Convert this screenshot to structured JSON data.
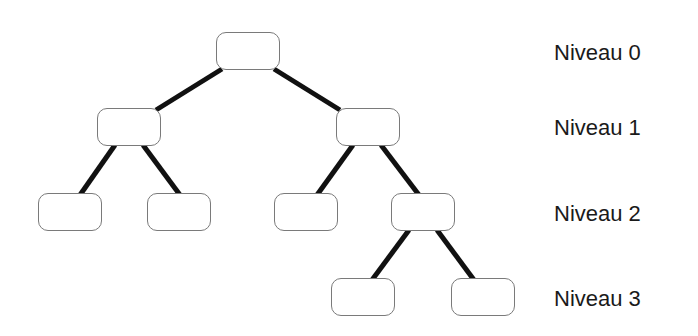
{
  "diagram": {
    "type": "binary-tree",
    "levels": [
      {
        "label": "Niveau 0",
        "y": 42
      },
      {
        "label": "Niveau 1",
        "y": 117
      },
      {
        "label": "Niveau 2",
        "y": 203
      },
      {
        "label": "Niveau 3",
        "y": 288
      }
    ],
    "nodes": [
      {
        "id": "n0",
        "level": 0,
        "x": 216,
        "y": 32
      },
      {
        "id": "n1",
        "level": 1,
        "x": 97,
        "y": 108
      },
      {
        "id": "n2",
        "level": 1,
        "x": 336,
        "y": 108
      },
      {
        "id": "n3",
        "level": 2,
        "x": 38,
        "y": 193
      },
      {
        "id": "n4",
        "level": 2,
        "x": 147,
        "y": 193
      },
      {
        "id": "n5",
        "level": 2,
        "x": 274,
        "y": 193
      },
      {
        "id": "n6",
        "level": 2,
        "x": 391,
        "y": 193
      },
      {
        "id": "n7",
        "level": 3,
        "x": 331,
        "y": 278
      },
      {
        "id": "n8",
        "level": 3,
        "x": 451,
        "y": 278
      }
    ],
    "edges": [
      {
        "from": "n0",
        "to": "n1"
      },
      {
        "from": "n0",
        "to": "n2"
      },
      {
        "from": "n1",
        "to": "n3"
      },
      {
        "from": "n1",
        "to": "n4"
      },
      {
        "from": "n2",
        "to": "n5"
      },
      {
        "from": "n2",
        "to": "n6"
      },
      {
        "from": "n6",
        "to": "n7"
      },
      {
        "from": "n6",
        "to": "n8"
      }
    ],
    "colors": {
      "edge": "#111111",
      "node_border": "#7a7a7a",
      "text": "#1a1a1a"
    }
  }
}
